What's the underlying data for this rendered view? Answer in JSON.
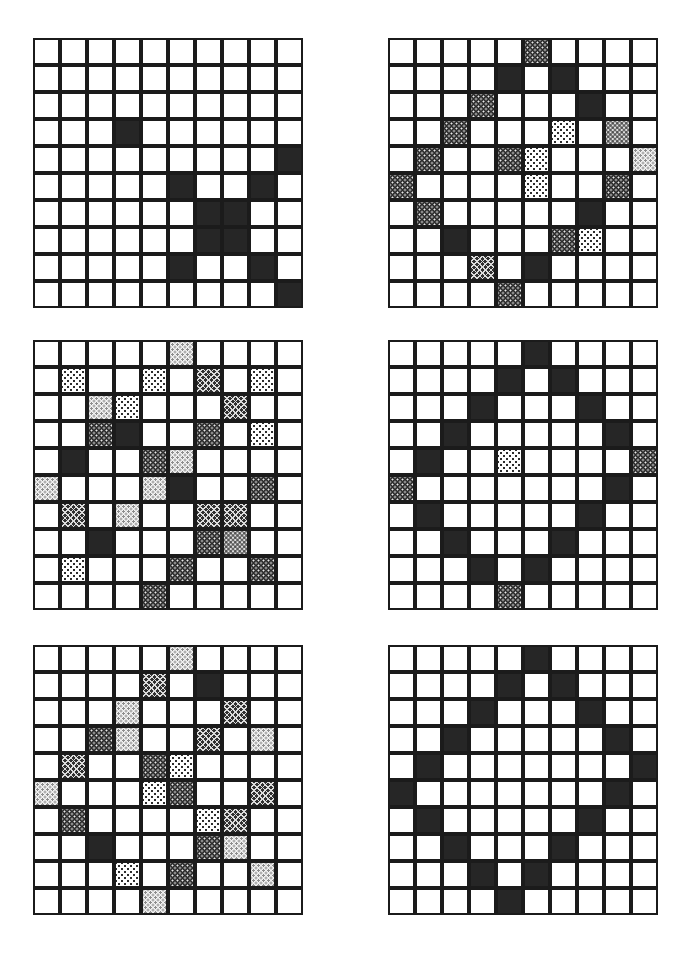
{
  "figure": {
    "kind": "grid-pattern-panels",
    "panel_count": 6,
    "grid_rows": 10,
    "grid_cols": 10,
    "cell_size_px": 27,
    "colors": {
      "background": "#ffffff",
      "cell_border": "#1b1b1b",
      "solid_fill": "#262626",
      "dark_dot_fill": "#2b2b2b",
      "hatch_fill": "#303030",
      "light_dot_fill": "#ffffff",
      "stipple_fill": "#f2f2f2",
      "mid_stipple_fill": "#e3e3e3"
    },
    "shade_legend": {
      "0": "empty",
      "solid": "solid-dark",
      "darkdot": "dark-with-light-dots",
      "hatch": "dark-crosshatch",
      "lightdot": "light-with-dark-dots",
      "stipple": "pale-stipple",
      "midstipple": "mid-grey-stipple"
    },
    "panels": [
      {
        "name": "panel-top-left",
        "position": {
          "left": 33,
          "top": 38
        },
        "cells": [
          [
            "0",
            "0",
            "0",
            "0",
            "0",
            "0",
            "0",
            "0",
            "0",
            "0"
          ],
          [
            "0",
            "0",
            "0",
            "0",
            "0",
            "0",
            "0",
            "0",
            "0",
            "0"
          ],
          [
            "0",
            "0",
            "0",
            "0",
            "0",
            "0",
            "0",
            "0",
            "0",
            "0"
          ],
          [
            "0",
            "0",
            "0",
            "solid",
            "0",
            "0",
            "0",
            "0",
            "0",
            "0"
          ],
          [
            "0",
            "0",
            "0",
            "0",
            "0",
            "0",
            "0",
            "0",
            "0",
            "solid"
          ],
          [
            "0",
            "0",
            "0",
            "0",
            "0",
            "solid",
            "0",
            "0",
            "solid",
            "0"
          ],
          [
            "0",
            "0",
            "0",
            "0",
            "0",
            "0",
            "solid",
            "solid",
            "0",
            "0"
          ],
          [
            "0",
            "0",
            "0",
            "0",
            "0",
            "0",
            "solid",
            "solid",
            "0",
            "0"
          ],
          [
            "0",
            "0",
            "0",
            "0",
            "0",
            "solid",
            "0",
            "0",
            "solid",
            "0"
          ],
          [
            "0",
            "0",
            "0",
            "0",
            "0",
            "0",
            "0",
            "0",
            "0",
            "solid"
          ]
        ]
      },
      {
        "name": "panel-top-right",
        "position": {
          "left": 388,
          "top": 38
        },
        "cells": [
          [
            "0",
            "0",
            "0",
            "0",
            "0",
            "darkdot",
            "0",
            "0",
            "0",
            "0"
          ],
          [
            "0",
            "0",
            "0",
            "0",
            "solid",
            "0",
            "solid",
            "0",
            "0",
            "0"
          ],
          [
            "0",
            "0",
            "0",
            "darkdot",
            "0",
            "0",
            "0",
            "solid",
            "0",
            "0"
          ],
          [
            "0",
            "0",
            "darkdot",
            "0",
            "0",
            "0",
            "lightdot",
            "0",
            "midstipple",
            "0"
          ],
          [
            "0",
            "darkdot",
            "0",
            "0",
            "darkdot",
            "lightdot",
            "0",
            "0",
            "0",
            "stipple"
          ],
          [
            "darkdot",
            "0",
            "0",
            "0",
            "0",
            "lightdot",
            "0",
            "0",
            "darkdot",
            "0"
          ],
          [
            "0",
            "darkdot",
            "0",
            "0",
            "0",
            "0",
            "0",
            "solid",
            "0",
            "0"
          ],
          [
            "0",
            "0",
            "solid",
            "0",
            "0",
            "0",
            "darkdot",
            "lightdot",
            "0",
            "0"
          ],
          [
            "0",
            "0",
            "0",
            "hatch",
            "0",
            "solid",
            "0",
            "0",
            "0",
            "0"
          ],
          [
            "0",
            "0",
            "0",
            "0",
            "darkdot",
            "0",
            "0",
            "0",
            "0",
            "0"
          ]
        ]
      },
      {
        "name": "panel-middle-left",
        "position": {
          "left": 33,
          "top": 340
        },
        "cells": [
          [
            "0",
            "0",
            "0",
            "0",
            "0",
            "stipple",
            "0",
            "0",
            "0",
            "0"
          ],
          [
            "0",
            "lightdot",
            "0",
            "0",
            "lightdot",
            "0",
            "hatch",
            "0",
            "lightdot",
            "0"
          ],
          [
            "0",
            "0",
            "stipple",
            "lightdot",
            "0",
            "0",
            "0",
            "hatch",
            "0",
            "0"
          ],
          [
            "0",
            "0",
            "darkdot",
            "solid",
            "0",
            "0",
            "darkdot",
            "0",
            "lightdot",
            "0"
          ],
          [
            "0",
            "solid",
            "0",
            "0",
            "darkdot",
            "stipple",
            "0",
            "0",
            "0",
            "0"
          ],
          [
            "stipple",
            "0",
            "0",
            "0",
            "stipple",
            "solid",
            "0",
            "0",
            "darkdot",
            "0"
          ],
          [
            "0",
            "hatch",
            "0",
            "stipple",
            "0",
            "0",
            "hatch",
            "hatch",
            "0",
            "0"
          ],
          [
            "0",
            "0",
            "solid",
            "0",
            "0",
            "0",
            "darkdot",
            "midstipple",
            "0",
            "0"
          ],
          [
            "0",
            "lightdot",
            "0",
            "0",
            "0",
            "darkdot",
            "0",
            "0",
            "darkdot",
            "0"
          ],
          [
            "0",
            "0",
            "0",
            "0",
            "darkdot",
            "0",
            "0",
            "0",
            "0",
            "0"
          ]
        ]
      },
      {
        "name": "panel-middle-right",
        "position": {
          "left": 388,
          "top": 340
        },
        "cells": [
          [
            "0",
            "0",
            "0",
            "0",
            "0",
            "solid",
            "0",
            "0",
            "0",
            "0"
          ],
          [
            "0",
            "0",
            "0",
            "0",
            "solid",
            "0",
            "solid",
            "0",
            "0",
            "0"
          ],
          [
            "0",
            "0",
            "0",
            "solid",
            "0",
            "0",
            "0",
            "solid",
            "0",
            "0"
          ],
          [
            "0",
            "0",
            "solid",
            "0",
            "0",
            "0",
            "0",
            "0",
            "solid",
            "0"
          ],
          [
            "0",
            "solid",
            "0",
            "0",
            "lightdot",
            "0",
            "0",
            "0",
            "0",
            "darkdot"
          ],
          [
            "darkdot",
            "0",
            "0",
            "0",
            "0",
            "0",
            "0",
            "0",
            "solid",
            "0"
          ],
          [
            "0",
            "solid",
            "0",
            "0",
            "0",
            "0",
            "0",
            "solid",
            "0",
            "0"
          ],
          [
            "0",
            "0",
            "solid",
            "0",
            "0",
            "0",
            "solid",
            "0",
            "0",
            "0"
          ],
          [
            "0",
            "0",
            "0",
            "solid",
            "0",
            "solid",
            "0",
            "0",
            "0",
            "0"
          ],
          [
            "0",
            "0",
            "0",
            "0",
            "darkdot",
            "0",
            "0",
            "0",
            "0",
            "0"
          ]
        ]
      },
      {
        "name": "panel-bottom-left",
        "position": {
          "left": 33,
          "top": 645
        },
        "cells": [
          [
            "0",
            "0",
            "0",
            "0",
            "0",
            "stipple",
            "0",
            "0",
            "0",
            "0"
          ],
          [
            "0",
            "0",
            "0",
            "0",
            "hatch",
            "0",
            "solid",
            "0",
            "0",
            "0"
          ],
          [
            "0",
            "0",
            "0",
            "stipple",
            "0",
            "0",
            "0",
            "hatch",
            "0",
            "0"
          ],
          [
            "0",
            "0",
            "darkdot",
            "stipple",
            "0",
            "0",
            "hatch",
            "0",
            "stipple",
            "0"
          ],
          [
            "0",
            "hatch",
            "0",
            "0",
            "darkdot",
            "lightdot",
            "0",
            "0",
            "0",
            "0"
          ],
          [
            "stipple",
            "0",
            "0",
            "0",
            "lightdot",
            "darkdot",
            "0",
            "0",
            "hatch",
            "0"
          ],
          [
            "0",
            "darkdot",
            "0",
            "0",
            "0",
            "0",
            "lightdot",
            "hatch",
            "0",
            "0"
          ],
          [
            "0",
            "0",
            "solid",
            "0",
            "0",
            "0",
            "darkdot",
            "stipple",
            "0",
            "0"
          ],
          [
            "0",
            "0",
            "0",
            "lightdot",
            "0",
            "darkdot",
            "0",
            "0",
            "stipple",
            "0"
          ],
          [
            "0",
            "0",
            "0",
            "0",
            "stipple",
            "0",
            "0",
            "0",
            "0",
            "0"
          ]
        ]
      },
      {
        "name": "panel-bottom-right",
        "position": {
          "left": 388,
          "top": 645
        },
        "cells": [
          [
            "0",
            "0",
            "0",
            "0",
            "0",
            "solid",
            "0",
            "0",
            "0",
            "0"
          ],
          [
            "0",
            "0",
            "0",
            "0",
            "solid",
            "0",
            "solid",
            "0",
            "0",
            "0"
          ],
          [
            "0",
            "0",
            "0",
            "solid",
            "0",
            "0",
            "0",
            "solid",
            "0",
            "0"
          ],
          [
            "0",
            "0",
            "solid",
            "0",
            "0",
            "0",
            "0",
            "0",
            "solid",
            "0"
          ],
          [
            "0",
            "solid",
            "0",
            "0",
            "0",
            "0",
            "0",
            "0",
            "0",
            "solid"
          ],
          [
            "solid",
            "0",
            "0",
            "0",
            "0",
            "0",
            "0",
            "0",
            "solid",
            "0"
          ],
          [
            "0",
            "solid",
            "0",
            "0",
            "0",
            "0",
            "0",
            "solid",
            "0",
            "0"
          ],
          [
            "0",
            "0",
            "solid",
            "0",
            "0",
            "0",
            "solid",
            "0",
            "0",
            "0"
          ],
          [
            "0",
            "0",
            "0",
            "solid",
            "0",
            "solid",
            "0",
            "0",
            "0",
            "0"
          ],
          [
            "0",
            "0",
            "0",
            "0",
            "solid",
            "0",
            "0",
            "0",
            "0",
            "0"
          ]
        ]
      }
    ]
  }
}
